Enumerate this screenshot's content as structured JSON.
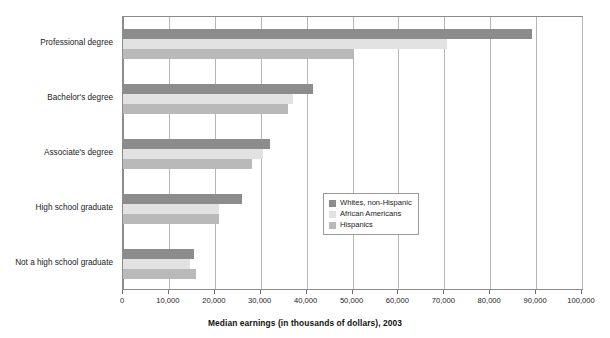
{
  "chart_data": {
    "type": "bar",
    "orientation": "horizontal",
    "title": "",
    "xlabel": "Median earnings (in thousands of dollars), 2003",
    "ylabel": "",
    "xlim": [
      0,
      100000
    ],
    "xticks": [
      0,
      10000,
      20000,
      30000,
      40000,
      50000,
      60000,
      70000,
      80000,
      90000,
      100000
    ],
    "xtick_labels": [
      "0",
      "10,000",
      "20,000",
      "30,000",
      "40,000",
      "50,000",
      "60,000",
      "70,000",
      "80,000",
      "90,000",
      "100,000"
    ],
    "grid": true,
    "legend_position": "center-right-inside",
    "categories": [
      "Professional degree",
      "Bachelor's degree",
      "Associate's degree",
      "High school graduate",
      "Not a high school graduate"
    ],
    "series": [
      {
        "name": "Whites, non-Hispanic",
        "color": "#8c8c8c",
        "values": [
          89000,
          41500,
          32000,
          26000,
          15500
        ]
      },
      {
        "name": "African Americans",
        "color": "#e2e2e2",
        "values": [
          70500,
          37000,
          30500,
          21000,
          14500
        ]
      },
      {
        "name": "Hispanics",
        "color": "#b9b9b9",
        "values": [
          50000,
          36000,
          28000,
          21000,
          16000
        ]
      }
    ]
  },
  "legend": {
    "entries": [
      {
        "label": "Whites, non-Hispanic",
        "color": "#8c8c8c"
      },
      {
        "label": "African Americans",
        "color": "#e2e2e2"
      },
      {
        "label": "Hispanics",
        "color": "#b9b9b9"
      }
    ]
  },
  "axis": {
    "x_title": "Median earnings (in thousands of dollars), 2003"
  }
}
